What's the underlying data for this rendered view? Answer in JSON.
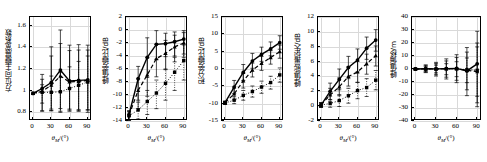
{
  "figure": {
    "panel_count": 5,
    "xlabel_main": "θ",
    "xlabel_sub": "M",
    "xlabel_unit": "/(°)",
    "xticks": [
      0,
      30,
      60,
      90
    ],
    "xlim": [
      -5,
      97
    ],
    "series_names": [
      "solid-circle",
      "dashed-triangle",
      "dotted-square"
    ],
    "colors": {
      "line": "#000000",
      "grid": "#d9d9d9",
      "axis": "#000000",
      "background": "#ffffff"
    }
  },
  "chart_data": [
    {
      "type": "line",
      "panel_index": 1,
      "ylabel": "方位向主瓣展宽系数",
      "xlabel": "θM/(°)",
      "x": [
        0,
        15,
        30,
        45,
        60,
        75,
        90
      ],
      "yticks": [
        0.8,
        1.0,
        1.2,
        1.4,
        1.6
      ],
      "ylim": [
        0.72,
        1.68
      ],
      "grid": true,
      "series": [
        {
          "name": "solid-circle",
          "style": "solid",
          "marker": "circle",
          "values": [
            0.975,
            1.02,
            1.075,
            1.19,
            1.09,
            1.095,
            1.1
          ],
          "err_low": [
            0.0,
            0.21,
            0.26,
            0.38,
            0.27,
            0.28,
            0.3
          ],
          "err_high": [
            0.0,
            0.13,
            0.33,
            0.37,
            0.33,
            0.33,
            0.32
          ]
        },
        {
          "name": "dashed-triangle",
          "style": "dashed",
          "marker": "triangle",
          "values": [
            0.975,
            0.995,
            1.05,
            1.135,
            1.08,
            1.085,
            1.095
          ],
          "err_low": [
            0.0,
            0.18,
            0.22,
            0.3,
            0.25,
            0.26,
            0.27
          ],
          "err_high": [
            0.0,
            0.11,
            0.27,
            0.3,
            0.29,
            0.29,
            0.28
          ]
        },
        {
          "name": "dotted-square",
          "style": "dotted",
          "marker": "square",
          "values": [
            0.975,
            0.985,
            0.985,
            0.99,
            1.02,
            1.05,
            1.08
          ],
          "err_low": [
            0.0,
            0.1,
            0.17,
            0.19,
            0.21,
            0.24,
            0.26
          ],
          "err_high": [
            0.0,
            0.07,
            0.15,
            0.18,
            0.2,
            0.22,
            0.24
          ]
        }
      ]
    },
    {
      "type": "line",
      "panel_index": 2,
      "ylabel": "峰值旁瓣比/dB",
      "xlabel": "θM/(°)",
      "x": [
        0,
        15,
        30,
        45,
        60,
        75,
        90
      ],
      "yticks": [
        -14,
        -12,
        -10,
        -8,
        -6,
        -4,
        -2,
        0,
        2
      ],
      "ylim": [
        -14,
        2
      ],
      "grid": true,
      "series": [
        {
          "name": "solid-circle",
          "style": "solid",
          "marker": "circle",
          "values": [
            -13.0,
            -7.5,
            -4.2,
            -2.2,
            -2.1,
            -1.8,
            -1.4
          ],
          "err_low": [
            0.8,
            3.3,
            3.1,
            2.3,
            2.0,
            2.2,
            2.3
          ],
          "err_high": [
            0.6,
            1.9,
            3.0,
            2.1,
            1.6,
            1.5,
            1.3
          ]
        },
        {
          "name": "dashed-triangle",
          "style": "dashed",
          "marker": "triangle",
          "values": [
            -13.1,
            -9.3,
            -6.9,
            -4.4,
            -3.6,
            -2.6,
            -2.0
          ],
          "err_low": [
            0.8,
            2.8,
            3.3,
            2.8,
            2.5,
            2.3,
            2.2
          ],
          "err_high": [
            0.6,
            1.8,
            2.6,
            2.2,
            2.0,
            1.8,
            1.6
          ]
        },
        {
          "name": "dotted-square",
          "style": "dotted",
          "marker": "square",
          "values": [
            -13.2,
            -12.3,
            -11.0,
            -9.7,
            -8.2,
            -6.5,
            -4.7
          ],
          "err_low": [
            0.7,
            1.4,
            2.0,
            2.4,
            2.6,
            2.8,
            3.0
          ],
          "err_high": [
            0.6,
            1.2,
            1.7,
            2.0,
            2.2,
            2.3,
            2.4
          ]
        }
      ]
    },
    {
      "type": "line",
      "panel_index": 3,
      "ylabel": "积分旁瓣比/dB",
      "xlabel": "θM/(°)",
      "x": [
        0,
        15,
        30,
        45,
        60,
        75,
        90
      ],
      "yticks": [
        -15,
        -10,
        -5,
        0,
        5,
        10,
        15
      ],
      "ylim": [
        -15,
        15
      ],
      "grid": true,
      "series": [
        {
          "name": "solid-circle",
          "style": "solid",
          "marker": "circle",
          "values": [
            -9.7,
            -5.2,
            -1.0,
            2.3,
            4.2,
            5.8,
            7.6
          ],
          "err_low": [
            0.4,
            1.9,
            2.3,
            2.1,
            2.0,
            2.0,
            1.9
          ],
          "err_high": [
            0.4,
            1.9,
            2.3,
            2.2,
            2.1,
            2.0,
            2.0
          ]
        },
        {
          "name": "dashed-triangle",
          "style": "dashed",
          "marker": "triangle",
          "values": [
            -9.7,
            -7.2,
            -3.4,
            -0.3,
            1.6,
            3.3,
            5.0
          ],
          "err_low": [
            0.4,
            1.7,
            2.1,
            2.0,
            2.0,
            1.9,
            1.9
          ],
          "err_high": [
            0.4,
            1.7,
            2.1,
            2.0,
            2.0,
            2.0,
            1.9
          ]
        },
        {
          "name": "dotted-square",
          "style": "dotted",
          "marker": "square",
          "values": [
            -9.8,
            -9.0,
            -7.6,
            -6.5,
            -5.2,
            -3.9,
            -1.7
          ],
          "err_low": [
            0.4,
            1.0,
            1.4,
            1.6,
            1.8,
            1.9,
            2.1
          ],
          "err_high": [
            0.4,
            1.0,
            1.4,
            1.6,
            1.7,
            1.8,
            2.0
          ]
        }
      ]
    },
    {
      "type": "line",
      "panel_index": 4,
      "ylabel": "峰值能量损失/dB",
      "xlabel": "θM/(°)",
      "x": [
        0,
        15,
        30,
        45,
        60,
        75,
        90
      ],
      "yticks": [
        -2,
        0,
        2,
        4,
        6,
        8,
        10,
        12
      ],
      "ylim": [
        -2,
        12
      ],
      "grid": true,
      "series": [
        {
          "name": "solid-circle",
          "style": "solid",
          "marker": "circle",
          "values": [
            0.15,
            2.0,
            3.6,
            5.2,
            6.2,
            7.8,
            8.9
          ],
          "err_low": [
            0.3,
            1.1,
            1.4,
            1.5,
            1.6,
            1.5,
            1.5
          ],
          "err_high": [
            0.3,
            1.1,
            1.4,
            1.5,
            1.5,
            1.5,
            1.4
          ]
        },
        {
          "name": "dashed-triangle",
          "style": "dashed",
          "marker": "triangle",
          "values": [
            0.15,
            1.5,
            2.6,
            4.0,
            4.6,
            5.7,
            6.8
          ],
          "err_low": [
            0.3,
            0.9,
            1.2,
            1.3,
            1.4,
            1.4,
            1.4
          ],
          "err_high": [
            0.3,
            0.9,
            1.2,
            1.3,
            1.4,
            1.3,
            1.3
          ]
        },
        {
          "name": "dotted-square",
          "style": "dotted",
          "marker": "square",
          "values": [
            0.15,
            0.35,
            0.75,
            1.4,
            2.1,
            2.5,
            3.5
          ],
          "err_low": [
            0.3,
            0.5,
            0.8,
            1.0,
            1.1,
            1.2,
            1.3
          ],
          "err_high": [
            0.3,
            0.5,
            0.8,
            1.0,
            1.1,
            1.2,
            1.3
          ]
        }
      ]
    },
    {
      "type": "line",
      "panel_index": 5,
      "ylabel": "峰值偏移/m",
      "xlabel": "θM/(°)",
      "x": [
        0,
        15,
        30,
        45,
        60,
        75,
        90
      ],
      "yticks": [
        -40,
        -30,
        -20,
        -10,
        0,
        10,
        20,
        30,
        40
      ],
      "ylim": [
        -40,
        40
      ],
      "grid": true,
      "series": [
        {
          "name": "solid-circle",
          "style": "solid",
          "marker": "circle",
          "values": [
            0.0,
            0.2,
            0.1,
            0.3,
            0.5,
            -1.5,
            4.0
          ],
          "err_low": [
            0.5,
            3.0,
            5.5,
            8.0,
            11.0,
            19.0,
            30.0
          ],
          "err_high": [
            0.5,
            3.0,
            5.0,
            7.5,
            10.5,
            18.0,
            25.0
          ]
        },
        {
          "name": "dashed-triangle",
          "style": "dashed",
          "marker": "triangle",
          "values": [
            0.0,
            0.1,
            0.1,
            0.2,
            0.3,
            -1.0,
            -2.0
          ],
          "err_low": [
            0.5,
            2.5,
            4.5,
            6.5,
            9.0,
            15.0,
            27.0
          ],
          "err_high": [
            0.5,
            2.5,
            4.0,
            6.0,
            8.5,
            14.0,
            22.0
          ]
        },
        {
          "name": "dotted-square",
          "style": "dotted",
          "marker": "square",
          "values": [
            0.0,
            0.0,
            0.0,
            0.1,
            0.1,
            -0.5,
            -1.0
          ],
          "err_low": [
            0.4,
            1.8,
            3.0,
            4.5,
            6.0,
            10.0,
            20.0
          ],
          "err_high": [
            0.4,
            1.8,
            3.0,
            4.0,
            5.5,
            9.0,
            18.0
          ]
        }
      ]
    }
  ]
}
